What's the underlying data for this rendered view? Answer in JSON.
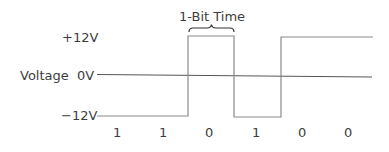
{
  "title": "1-Bit Time",
  "y_axis": {
    "label": "Voltage",
    "levels": [
      {
        "label": "+12V",
        "value": 12
      },
      {
        "label": "0V",
        "value": 0
      },
      {
        "label": "−12V",
        "value": -12
      }
    ]
  },
  "bits": [
    "1",
    "1",
    "0",
    "1",
    "0",
    "0"
  ],
  "waveform": {
    "description": "RS-232 style signal: logic 1 = -12V, logic 0 = +12V",
    "levels_by_bit": [
      -12,
      -12,
      12,
      -12,
      12,
      12
    ]
  },
  "colors": {
    "line": "#8a8a8a",
    "axis": "#4a4a4a",
    "text": "#3d3d3d"
  }
}
